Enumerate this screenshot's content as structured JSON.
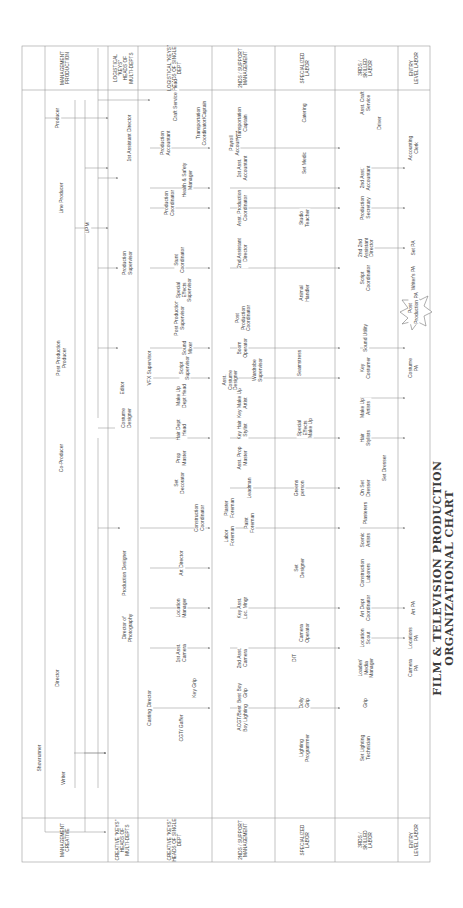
{
  "title": {
    "line1": "Film & Television Production",
    "line2": "Organizational Chart"
  },
  "sections": {
    "creative": "Creative",
    "production": "Production"
  },
  "row_headers": {
    "creative": [
      "Management\nCreative",
      "Creative \"Keys\"\nHeads of\nMulti-Depts",
      "Creative \"Keys\"\nHeads of Single\nDept",
      "2NDs / Support\nManagement",
      "Specialized\nLabor",
      "3rds /\nSkilled\nLabor",
      "Entry\nLevel Labor"
    ],
    "production": [
      "Management\nProduction",
      "Logistical\n\"Keys\"\nHeads of\nMulti-Depts",
      "Logistical \"Keys\"\nHeads of Single\nDept",
      "2NDs / Support\nManagement",
      "Specialized\nLabor",
      "3rds /\nSkilled\nLabor",
      "Entry\nLevel Labor"
    ]
  },
  "nodes": {
    "showrunner": "Showrunner",
    "writer": "Writer",
    "director": "Director",
    "co_producer": "Co-Producer",
    "producer": "Producer",
    "post_production_producer": "Post Production\nProducer",
    "line_producer": "Line Producer",
    "upm": "UPM",
    "director_of_photography": "Director of\nPhotography",
    "casting_director": "Casting Director",
    "production_designer": "Production Designer",
    "costume_designer": "Costume\nDesigner",
    "editor": "Editor",
    "vfx_supervisor": "VFX Supervisor",
    "first_ad": "1st Assistant Director",
    "production_supervisor": "Production\nSupervisor",
    "production_coordinator": "Production\nCoordinator",
    "health_safety_manager": "Health & Safety\nManager",
    "production_accountant": "Production\nAccountant",
    "craft_service_head": "Craft Service Head",
    "transportation_coordinator": "Transportation\nCoordinator/Captain",
    "cgt_gaffer": "CGT/ Gaffer",
    "key_grip": "Key Grip",
    "first_asst_camera": "1st Asst.\nCamera",
    "location_manager": "Location\nManager",
    "art_director": "Art Director",
    "construction_coordinator": "Construction\nCoordinator",
    "set_decorator": "Set\nDecorator",
    "prop_master": "Prop\nMaster",
    "hair_dept_head": "Hair Dept\nHead",
    "makeup_dept_head": "Make Up\nDept Head",
    "script_supervisor": "Script\nSupervisor",
    "sound_mixer": "Sound\nMixer",
    "post_production_supervisor": "Post Production\nSupervisor",
    "special_effects_supervisor": "Special\nEffects\nSupervisor",
    "stunt_coordinator": "Stunt\nCoordinator",
    "acgt_best_boy_lighting": "ACGT/Best\nBoy Lighting",
    "best_boy_grip": "Best Boy\nGrip",
    "second_asst_camera": "2nd Asst.\nCamera",
    "key_asst_loc_mngr": "Key Asst.\nLoc. Mngr",
    "labor_foreman": "Labor\nForeman",
    "paint_foreman": "Paint\nForeman",
    "plaster_foreman": "Plaster\nForeman",
    "leadman": "Leadman",
    "asst_prop_master": "Asst. Prop\nMaster",
    "key_hair_stylist": "Key Hair\nStylist",
    "key_makeup_artist": "Key Make Up\nArtist",
    "asst_costume_designer": "Asst.\nCostume\nDesigner",
    "wardrobe_supervisor": "Wardrobe\nSupervisor",
    "boom_operator": "Boom\nOperator",
    "post_production_coordinator": "Post\nProduction\nCoordinator",
    "second_ad": "2nd Assistant\nDirector",
    "asst_production_coordinator": "Asst. Production\nCoordinator",
    "first_asst_accountant": "1st Asst.\nAccountant",
    "payroll_accountant": "Payroll\nAccountant",
    "transportation_captain": "Transportation\nCaptain",
    "lighting_programmer": "Lighting\nProgrammer",
    "dolly_grip": "Dolly\nGrip",
    "dit": "DIT",
    "camera_operator": "Camera\nOperator",
    "set_designer": "Set\nDesigner",
    "greens_person": "Greens\nperson",
    "special_effects_makeup": "Special\nEffects\nMake Up",
    "seamstress": "Seamstress",
    "animal_handler": "Animal\nHandler",
    "studio_teacher": "Studio\nTeacher",
    "set_medic": "Set Medic",
    "catering": "Catering",
    "set_lighting_technician": "Set Lighting\nTechnician",
    "grip": "Grip",
    "loader_media_manager": "Loader/\nMedia\nManager",
    "location_scout": "Location\nScout",
    "art_dept_coordinator": "Art Dept\nCoordinator",
    "construction_laborers": "Construction\nLaborers",
    "scenic_artists": "Scenic\nArtists",
    "plasterers": "Plasterers",
    "on_set_dresser": "On Set\nDresser",
    "set_dresser": "Set Dresser",
    "hair_stylists": "Hair\nStylists",
    "makeup_artists": "Make Up\nArtists",
    "key_costumer": "Key\nCostumer",
    "sound_utility": "Sound Utility",
    "script_coordinator": "Script\nCoordinator",
    "second_second_ad": "2nd 2nd\nAssistant\nDirector",
    "production_secretary": "Production\nSecretary",
    "second_asst_accountant": "2nd Asst.\nAccountant",
    "asst_craft_service": "Asst. Craft\nService",
    "driver": "Driver",
    "camera_pa": "Camera\nPA",
    "locations_pa": "Locations\nPA",
    "art_pa": "Art PA",
    "costume_pa": "Costume\nPA",
    "post_production_pa": "Post\nProduction PA",
    "writers_pa": "Writer's PA",
    "set_pa": "Set PA",
    "office_pa": "Office PA",
    "accounting_clerk": "Accounting\nClerk"
  },
  "colors": {
    "line": "#8a8a8a",
    "text": "#444444",
    "background": "#ffffff",
    "title": "#3a3a3a"
  }
}
